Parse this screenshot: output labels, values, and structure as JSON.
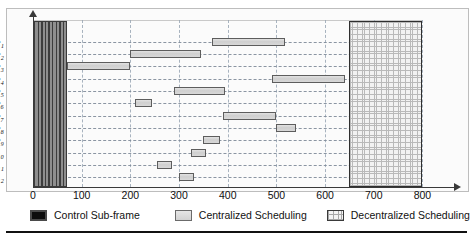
{
  "chart_data": {
    "type": "bar",
    "orientation": "horizontal",
    "title": "",
    "subtitle": "",
    "xlabel": "",
    "ylabel": "",
    "xlim": [
      0,
      840
    ],
    "xticks": [
      0,
      100,
      200,
      300,
      400,
      500,
      600,
      700,
      800
    ],
    "xtick_labels": [
      "0",
      "100",
      "200",
      "300",
      "400",
      "500",
      "600",
      "700",
      "800"
    ],
    "categories": [
      "e1",
      "e2",
      "e3",
      "e4",
      "e5",
      "e6",
      "e7",
      "e8",
      "e9",
      "e10",
      "e11",
      "e12"
    ],
    "category_labels": [
      "e₁",
      "e₂",
      "e₃",
      "e₄",
      "e₅",
      "e₆",
      "e₇",
      "e₈",
      "e₉",
      "e₁₀",
      "e₁₁",
      "e₁₂"
    ],
    "grid": "dashed both axes",
    "legend_position": "below axis",
    "series": [
      {
        "name": "Control Sub-frame",
        "style": "dark-vertical-hatch",
        "color": "#3c3c3c",
        "spans": [
          {
            "row": "all",
            "start": 0,
            "end": 70
          }
        ]
      },
      {
        "name": "Centralized Scheduling",
        "style": "light-grey-fill",
        "color": "#d4d4d4",
        "bars": [
          {
            "row": "e1",
            "start": 368,
            "end": 518
          },
          {
            "row": "e2",
            "start": 200,
            "end": 345
          },
          {
            "row": "e3",
            "start": 70,
            "end": 200
          },
          {
            "row": "e4",
            "start": 490,
            "end": 640
          },
          {
            "row": "e5",
            "start": 290,
            "end": 395
          },
          {
            "row": "e6",
            "start": 210,
            "end": 245
          },
          {
            "row": "e7",
            "start": 390,
            "end": 500
          },
          {
            "row": "e8",
            "start": 500,
            "end": 540
          },
          {
            "row": "e9",
            "start": 350,
            "end": 385
          },
          {
            "row": "e10",
            "start": 325,
            "end": 355
          },
          {
            "row": "e11",
            "start": 255,
            "end": 285
          },
          {
            "row": "e12",
            "start": 300,
            "end": 330
          }
        ]
      },
      {
        "name": "Decentralized Scheduling",
        "style": "cross-hatch",
        "color": "#f2f2f2",
        "spans": [
          {
            "row": "all",
            "start": 650,
            "end": 800
          }
        ]
      }
    ]
  },
  "legend": {
    "items": [
      {
        "label": "Control Sub-frame",
        "swatch": "control-subframe-swatch"
      },
      {
        "label": "Centralized Scheduling",
        "swatch": "centralized-scheduling-swatch"
      },
      {
        "label": "Decentralized Scheduling",
        "swatch": "decentralized-scheduling-swatch"
      }
    ]
  }
}
